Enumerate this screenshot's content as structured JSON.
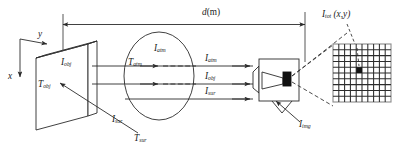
{
  "figure": {
    "type": "thermal-imaging-radiometry-diagram",
    "title_label": "",
    "background": "#ffffff",
    "stroke": "#2b2b2b"
  },
  "axes": {
    "y_label": "y",
    "x_label": "x"
  },
  "distance": {
    "symbol": "d",
    "unit": "(m)",
    "full": "d(m)"
  },
  "object": {
    "name": "object-plate",
    "radiance_symbol": "I",
    "radiance_sub": "obj",
    "temperature_symbol": "T",
    "temperature_sub": "obj"
  },
  "atmosphere": {
    "name": "atmosphere-ellipse",
    "radiance_symbol": "I",
    "radiance_sub": "atm",
    "transmittance_symbol": "T",
    "transmittance_sub": "atm"
  },
  "surroundings": {
    "radiance_symbol": "I",
    "radiance_sub": "sur",
    "temperature_symbol": "T",
    "temperature_sub": "sur"
  },
  "incoming_rays": [
    {
      "symbol": "I",
      "sub": "atm"
    },
    {
      "symbol": "I",
      "sub": "obj"
    },
    {
      "symbol": "I",
      "sub": "sur"
    }
  ],
  "camera": {
    "name": "infrared-camera",
    "image_symbol": "I",
    "image_sub": "img"
  },
  "detector_array": {
    "name": "pixel-grid",
    "columns": 10,
    "rows": 10,
    "highlighted_pixel": {
      "column": 5,
      "row": 5
    },
    "total_symbol": "I",
    "total_sub": "tot",
    "total_args": "(x,y)"
  }
}
